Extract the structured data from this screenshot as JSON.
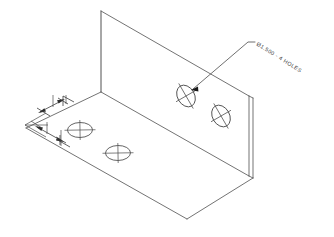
{
  "drawing": {
    "title": "Isometric bracket part drawing",
    "background_color": "#ffffff",
    "line_color": "#4a4a4a",
    "text_color": "#3a3a3a",
    "view_type": "isometric"
  },
  "annotations": {
    "hole_callout": {
      "text": "Ø1.500 - 4 HOLES",
      "diameter_symbol": "Ø",
      "diameter_value": "1.500",
      "quantity": "4",
      "feature": "HOLES",
      "leader_target": "hole-vertical-left"
    }
  },
  "features": {
    "faces": [
      {
        "name": "vertical-back-plate",
        "hole_count": 2
      },
      {
        "name": "horizontal-base-plate",
        "hole_count": 2
      }
    ],
    "holes": [
      {
        "id": "hole-vertical-left",
        "face": "vertical-back-plate"
      },
      {
        "id": "hole-vertical-right",
        "face": "vertical-back-plate"
      },
      {
        "id": "hole-base-left",
        "face": "horizontal-base-plate"
      },
      {
        "id": "hole-base-right",
        "face": "horizontal-base-plate"
      }
    ]
  },
  "dimensions": {
    "stack": [
      {
        "id": "dim-upper",
        "orientation": "isometric-receding"
      },
      {
        "id": "dim-lower",
        "orientation": "isometric-receding"
      }
    ]
  }
}
